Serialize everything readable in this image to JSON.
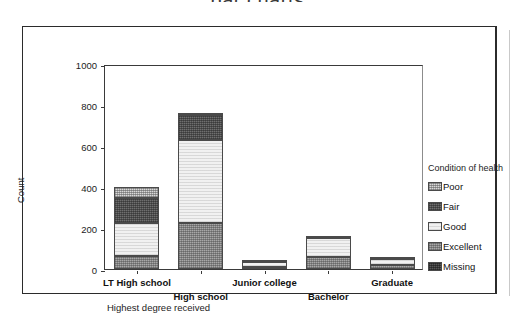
{
  "page": {
    "title": "bar charts"
  },
  "chart_data": {
    "type": "bar",
    "subtype": "stacked",
    "title": "",
    "xlabel": "Highest degree received",
    "ylabel": "Count",
    "ylim": [
      0,
      1000
    ],
    "yticks": [
      0,
      200,
      400,
      600,
      800,
      1000
    ],
    "ytick_labels": [
      "0",
      "200",
      "400",
      "600",
      "800",
      "1000"
    ],
    "grid": false,
    "legend_title": "Condition of health",
    "legend_position": "right",
    "categories": [
      "LT High school",
      "High school",
      "Junior college",
      "Bachelor",
      "Graduate"
    ],
    "series": [
      {
        "name": "Excellent",
        "fill": "fill-excellent",
        "values": [
          65,
          225,
          12,
          60,
          18
        ]
      },
      {
        "name": "Good",
        "fill": "fill-good",
        "values": [
          160,
          405,
          21,
          90,
          32
        ]
      },
      {
        "name": "Fair",
        "fill": "fill-fair",
        "values": [
          120,
          120,
          0,
          0,
          0
        ]
      },
      {
        "name": "Poor",
        "fill": "fill-poor",
        "values": [
          53,
          10,
          7,
          10,
          5
        ]
      },
      {
        "name": "Missing",
        "fill": "fill-missing",
        "values": [
          0,
          0,
          0,
          0,
          0
        ]
      }
    ],
    "totals": [
      398,
      760,
      40,
      160,
      55
    ],
    "legend_entries": [
      {
        "label": "Poor",
        "fill": "fill-poor"
      },
      {
        "label": "Fair",
        "fill": "fill-fair"
      },
      {
        "label": "Good",
        "fill": "fill-good"
      },
      {
        "label": "Excellent",
        "fill": "fill-excellent"
      },
      {
        "label": "Missing",
        "fill": "fill-missing"
      }
    ],
    "stack_order_bottom_to_top": [
      "Excellent",
      "Good",
      "Fair",
      "Poor",
      "Missing"
    ]
  }
}
